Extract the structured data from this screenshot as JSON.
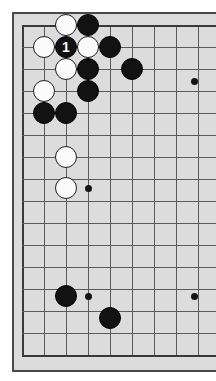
{
  "figure": {
    "kind": "go-board-diagram",
    "board_background_color": "#dcdcdc",
    "frame_color": "#4a4a4a",
    "line_color": "#5a5a5a",
    "black_stone_color": "#121212",
    "white_stone_color": "#fbfbfb"
  },
  "board": {
    "origin_x": 22,
    "origin_y": 25,
    "spacing": 22,
    "columns": 9,
    "rows": 16,
    "stone_radius": 11,
    "edges": {
      "left_x": 22,
      "top_y": 25,
      "bottom_y": 355
    }
  },
  "hoshi_points": [
    {
      "name": "star-point-upper-right",
      "x": 194,
      "y": 81
    },
    {
      "name": "star-point-left-middle",
      "x": 88,
      "y": 188
    },
    {
      "name": "star-point-lower-right",
      "x": 194,
      "y": 296
    },
    {
      "name": "star-point-lower-left",
      "x": 88,
      "y": 296
    }
  ],
  "stones": [
    {
      "id": "w1",
      "color": "white",
      "x": 66,
      "y": 25,
      "label": ""
    },
    {
      "id": "b1",
      "color": "black",
      "x": 88,
      "y": 25,
      "label": ""
    },
    {
      "id": "w2",
      "color": "white",
      "x": 44,
      "y": 47,
      "label": ""
    },
    {
      "id": "b2",
      "color": "black",
      "x": 66,
      "y": 47,
      "label": "1"
    },
    {
      "id": "w3",
      "color": "white",
      "x": 88,
      "y": 47,
      "label": ""
    },
    {
      "id": "b3",
      "color": "black",
      "x": 110,
      "y": 47,
      "label": ""
    },
    {
      "id": "w4",
      "color": "white",
      "x": 66,
      "y": 69,
      "label": ""
    },
    {
      "id": "b4",
      "color": "black",
      "x": 88,
      "y": 69,
      "label": ""
    },
    {
      "id": "b5",
      "color": "black",
      "x": 132,
      "y": 69,
      "label": ""
    },
    {
      "id": "w5",
      "color": "white",
      "x": 44,
      "y": 91,
      "label": ""
    },
    {
      "id": "b6",
      "color": "black",
      "x": 88,
      "y": 91,
      "label": ""
    },
    {
      "id": "b7",
      "color": "black",
      "x": 44,
      "y": 113,
      "label": ""
    },
    {
      "id": "b8",
      "color": "black",
      "x": 66,
      "y": 113,
      "label": ""
    },
    {
      "id": "w6",
      "color": "white",
      "x": 66,
      "y": 157,
      "label": ""
    },
    {
      "id": "w7",
      "color": "white",
      "x": 66,
      "y": 188,
      "label": ""
    },
    {
      "id": "b9",
      "color": "black",
      "x": 66,
      "y": 296,
      "label": ""
    },
    {
      "id": "b10",
      "color": "black",
      "x": 110,
      "y": 318,
      "label": ""
    }
  ],
  "move_marker": {
    "label": "1",
    "stone_id": "b2",
    "description": "Black move number 1"
  }
}
